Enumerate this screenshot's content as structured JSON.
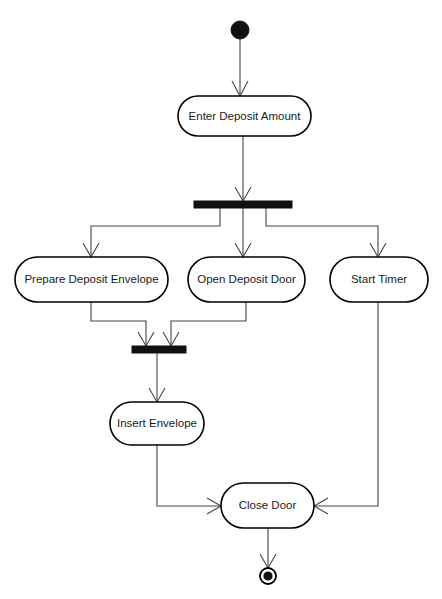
{
  "diagram": {
    "type": "uml-activity-diagram",
    "background_color": "#ffffff",
    "line_color": "#444444",
    "node_stroke_color": "#000000",
    "node_fill_color": "#ffffff",
    "bar_color": "#111111",
    "nodes": {
      "initial": {
        "kind": "initial-node",
        "label": "",
        "cx": 240,
        "cy": 30,
        "r": 9
      },
      "enter_deposit_amount": {
        "kind": "activity",
        "label": "Enter Deposit Amount",
        "x": 178,
        "y": 96,
        "w": 133,
        "h": 40
      },
      "fork": {
        "kind": "fork-bar",
        "label": "",
        "x": 194,
        "y": 201,
        "w": 98,
        "h": 7
      },
      "prepare_deposit_envelope": {
        "kind": "activity",
        "label": "Prepare Deposit Envelope",
        "x": 15,
        "y": 257,
        "w": 153,
        "h": 45
      },
      "open_deposit_door": {
        "kind": "activity",
        "label": "Open Deposit Door",
        "x": 188,
        "y": 257,
        "w": 117,
        "h": 45
      },
      "start_timer": {
        "kind": "activity",
        "label": "Start Timer",
        "x": 330,
        "y": 257,
        "w": 98,
        "h": 45
      },
      "join": {
        "kind": "join-bar",
        "label": "",
        "x": 132,
        "y": 346,
        "w": 54,
        "h": 7
      },
      "insert_envelope": {
        "kind": "activity",
        "label": "Insert Envelope",
        "x": 110,
        "y": 402,
        "w": 94,
        "h": 43
      },
      "close_door": {
        "kind": "activity",
        "label": "Close Door",
        "x": 221,
        "y": 483,
        "w": 93,
        "h": 45
      },
      "final": {
        "kind": "final-node",
        "label": "",
        "cx": 268,
        "cy": 576,
        "r_outer": 8,
        "r_inner": 4.6
      }
    },
    "edges": [
      {
        "name": "initial-to-enter-deposit-amount",
        "from": "initial",
        "to": "enter_deposit_amount"
      },
      {
        "name": "enter-deposit-amount-to-fork",
        "from": "enter_deposit_amount",
        "to": "fork"
      },
      {
        "name": "fork-to-prepare-deposit-envelope",
        "from": "fork",
        "to": "prepare_deposit_envelope"
      },
      {
        "name": "fork-to-open-deposit-door",
        "from": "fork",
        "to": "open_deposit_door"
      },
      {
        "name": "fork-to-start-timer",
        "from": "fork",
        "to": "start_timer"
      },
      {
        "name": "prepare-deposit-envelope-to-join",
        "from": "prepare_deposit_envelope",
        "to": "join"
      },
      {
        "name": "open-deposit-door-to-join",
        "from": "open_deposit_door",
        "to": "join"
      },
      {
        "name": "join-to-insert-envelope",
        "from": "join",
        "to": "insert_envelope"
      },
      {
        "name": "insert-envelope-to-close-door",
        "from": "insert_envelope",
        "to": "close_door"
      },
      {
        "name": "start-timer-to-close-door",
        "from": "start_timer",
        "to": "close_door"
      },
      {
        "name": "close-door-to-final",
        "from": "close_door",
        "to": "final"
      }
    ]
  }
}
